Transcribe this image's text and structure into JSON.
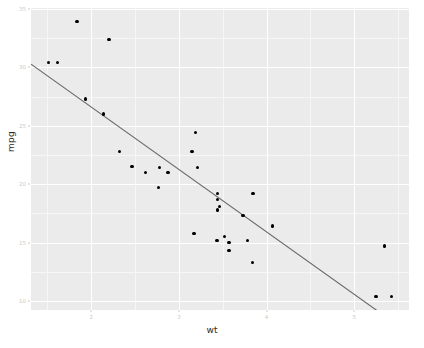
{
  "chart_data": {
    "type": "scatter",
    "title": "",
    "xlabel": "wt",
    "ylabel": "mpg",
    "xlim": [
      1.3125,
      5.6245
    ],
    "ylim": [
      9.225,
      35.075
    ],
    "x_ticks": [
      2,
      3,
      4,
      5
    ],
    "y_ticks": [
      10,
      15,
      20,
      25,
      30,
      35
    ],
    "x_tick_labels": [
      "2",
      "3",
      "4",
      "5"
    ],
    "y_tick_labels": [
      "10",
      "15",
      "20",
      "25",
      "30",
      "35"
    ],
    "x_minor_ticks": [
      1.5,
      2.5,
      3.5,
      4.5,
      5.5
    ],
    "y_minor_ticks": [
      12.5,
      17.5,
      22.5,
      27.5,
      32.5
    ],
    "grid": true,
    "legend": "none",
    "panel_background": "#ebebeb",
    "grid_major_color": "#ffffff",
    "grid_minor_color": "#f6f6f6",
    "point_color": "#000000",
    "fit_line_color": "#666666",
    "points": [
      {
        "x": 2.62,
        "y": 21.0
      },
      {
        "x": 2.875,
        "y": 21.0
      },
      {
        "x": 2.32,
        "y": 22.8
      },
      {
        "x": 3.215,
        "y": 21.4
      },
      {
        "x": 3.44,
        "y": 18.7
      },
      {
        "x": 3.46,
        "y": 18.1
      },
      {
        "x": 3.57,
        "y": 14.3
      },
      {
        "x": 3.19,
        "y": 24.4
      },
      {
        "x": 3.15,
        "y": 22.8
      },
      {
        "x": 3.44,
        "y": 19.2
      },
      {
        "x": 3.44,
        "y": 17.8
      },
      {
        "x": 4.07,
        "y": 16.4
      },
      {
        "x": 3.73,
        "y": 17.3
      },
      {
        "x": 3.78,
        "y": 15.2
      },
      {
        "x": 5.25,
        "y": 10.4
      },
      {
        "x": 5.424,
        "y": 10.4
      },
      {
        "x": 5.345,
        "y": 14.7
      },
      {
        "x": 2.2,
        "y": 32.4
      },
      {
        "x": 1.615,
        "y": 30.4
      },
      {
        "x": 1.835,
        "y": 33.9
      },
      {
        "x": 2.465,
        "y": 21.5
      },
      {
        "x": 3.52,
        "y": 15.5
      },
      {
        "x": 3.435,
        "y": 15.2
      },
      {
        "x": 3.84,
        "y": 13.3
      },
      {
        "x": 3.845,
        "y": 19.2
      },
      {
        "x": 1.935,
        "y": 27.3
      },
      {
        "x": 2.14,
        "y": 26.0
      },
      {
        "x": 1.513,
        "y": 30.4
      },
      {
        "x": 3.17,
        "y": 15.8
      },
      {
        "x": 2.77,
        "y": 19.7
      },
      {
        "x": 3.57,
        "y": 15.0
      },
      {
        "x": 2.78,
        "y": 21.4
      }
    ],
    "fit_line": {
      "method": "lm",
      "intercept": 37.285,
      "slope": -5.344,
      "se": false
    }
  }
}
